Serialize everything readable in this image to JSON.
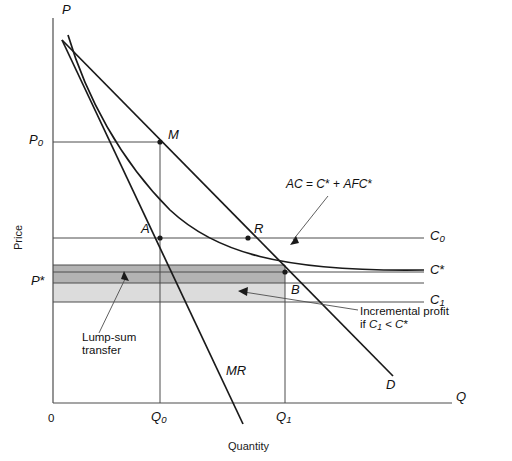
{
  "figure": {
    "type": "economics-diagram",
    "axes": {
      "y_axis_symbol": "P",
      "x_axis_symbol": "Q",
      "y_axis_title": "Price",
      "x_axis_title": "Quantity",
      "origin_label": "0"
    },
    "y_ticks": [
      {
        "id": "P0",
        "base": "P",
        "sub": "0",
        "star": false,
        "y": 142
      },
      {
        "id": "Pstar",
        "base": "P",
        "sub": "",
        "star": true,
        "y": 283
      }
    ],
    "x_ticks": [
      {
        "id": "Q0",
        "base": "Q",
        "sub": "0",
        "x": 160
      },
      {
        "id": "Q1",
        "base": "Q",
        "sub": "1",
        "x": 285
      }
    ],
    "cost_lines": [
      {
        "id": "C0",
        "base": "C",
        "sub": "0",
        "star": false,
        "y": 238,
        "label_x": 432
      },
      {
        "id": "Cstar",
        "base": "C",
        "sub": "",
        "star": true,
        "y": 272,
        "label_x": 432
      },
      {
        "id": "C1",
        "base": "C",
        "sub": "1",
        "star": false,
        "y": 293,
        "label_x": 432
      }
    ],
    "points": [
      {
        "id": "M",
        "label": "M",
        "x": 160,
        "y": 142
      },
      {
        "id": "A",
        "label": "A",
        "x": 160,
        "y": 238
      },
      {
        "id": "R",
        "label": "R",
        "x": 248,
        "y": 238
      },
      {
        "id": "B",
        "label": "B",
        "x": 285,
        "y": 272
      }
    ],
    "curves": [
      {
        "id": "demand",
        "label": "D",
        "label_x": 388,
        "label_y": 384
      },
      {
        "id": "marginal-revenue",
        "label": "MR",
        "label_x": 228,
        "label_y": 372
      },
      {
        "id": "average-cost",
        "label": "AC = C* + AFC*",
        "label_x": 288,
        "label_y": 185
      }
    ],
    "annotations": [
      {
        "id": "lump-sum",
        "lines": [
          "Lump-sum",
          "transfer"
        ],
        "x": 84,
        "y": 340
      },
      {
        "id": "incremental-profit",
        "lines": [
          "Incremental profit",
          "if C1 < C*"
        ],
        "x": 362,
        "y": 312
      }
    ],
    "shaded_regions": [
      {
        "id": "lump-sum-transfer",
        "color": "#b3b3b3",
        "x0": 53,
        "x1": 285,
        "y_top": 265,
        "y_bottom": 283
      },
      {
        "id": "incremental-profit-band",
        "color": "#dcdcdc",
        "x0": 53,
        "x1": 285,
        "y_top": 283,
        "y_bottom": 302
      }
    ],
    "colors": {
      "stroke": "#1a1a1a",
      "thin_line": "#4d4d4d",
      "dark_shade": "#b3b3b3",
      "light_shade": "#dcdcdc",
      "background": "#ffffff"
    }
  }
}
